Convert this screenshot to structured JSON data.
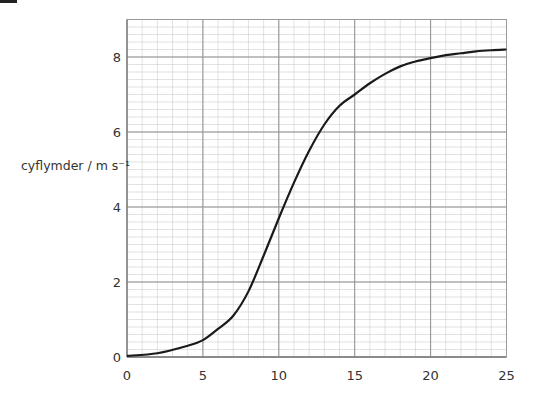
{
  "chart_data": {
    "type": "line",
    "title": "",
    "xlabel": "",
    "ylabel": "cyflymder / m s⁻¹",
    "xlim": [
      0,
      25
    ],
    "ylim": [
      0,
      9
    ],
    "x_ticks": [
      "0",
      "5",
      "10",
      "15",
      "20",
      "25"
    ],
    "y_ticks": [
      "0",
      "2",
      "4",
      "6",
      "8"
    ],
    "grid": true,
    "grid_minor_step_x": 1,
    "grid_minor_step_y": 0.2,
    "legend": null,
    "series": [
      {
        "name": "cyflymder",
        "color": "#1a1a1a",
        "x": [
          0,
          2,
          4,
          5,
          6,
          7,
          8,
          9,
          10,
          11,
          12,
          13,
          14,
          15,
          16,
          17,
          18,
          19,
          20,
          21,
          22,
          23,
          24,
          25
        ],
        "y": [
          0.03,
          0.1,
          0.3,
          0.45,
          0.75,
          1.1,
          1.75,
          2.7,
          3.7,
          4.65,
          5.5,
          6.2,
          6.7,
          7.0,
          7.3,
          7.55,
          7.75,
          7.88,
          7.97,
          8.05,
          8.1,
          8.15,
          8.18,
          8.2
        ]
      }
    ]
  }
}
